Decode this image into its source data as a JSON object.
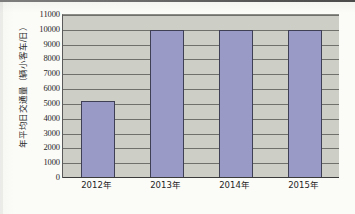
{
  "chart_data": {
    "type": "bar",
    "title": "",
    "xlabel": "",
    "ylabel": "年平均日交通量（辆小客车/日）",
    "categories": [
      "2012年",
      "2013年",
      "2014年",
      "2015年"
    ],
    "values": [
      5200,
      9980,
      9980,
      9980
    ],
    "ylim": [
      0,
      11000
    ],
    "ytick_step": 1000,
    "yticks": [
      11000,
      10000,
      9000,
      8000,
      7000,
      6000,
      5000,
      4000,
      3000,
      2000,
      1000,
      0
    ],
    "ytick_labels": [
      "11000",
      "10000",
      "9000",
      "8000",
      "7000",
      "6000",
      "5000",
      "4000",
      "3000",
      "2000",
      "1000",
      "0"
    ],
    "grid": true,
    "grid_axis": "y",
    "legend": false,
    "legend_position": "none",
    "series": [
      {
        "name": "年平均日交通量",
        "values": [
          5200,
          9980,
          9980,
          9980
        ]
      }
    ],
    "colors": {
      "bar_fill": "#9a9ac6",
      "bar_border": "#3f3f55",
      "plot_background": "#cdcec5",
      "gridline": "#5e5e5c",
      "axis": "#3b3b3b",
      "text": "#1f1f1f",
      "page_background": "#fbfbf8"
    }
  }
}
